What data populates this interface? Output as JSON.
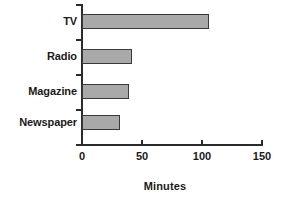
{
  "chart_data": {
    "type": "bar",
    "orientation": "horizontal",
    "title": "",
    "subtitle": "",
    "xlabel": "Minutes",
    "ylabel": "",
    "categories": [
      "TV",
      "Radio",
      "Magazine",
      "Newspaper"
    ],
    "values": [
      106,
      42,
      39,
      32
    ],
    "series": [
      {
        "name": "Minutes",
        "values": [
          106,
          42,
          39,
          32
        ]
      }
    ],
    "xlim": [
      0,
      150
    ],
    "xticks": [
      0,
      50,
      100,
      150
    ],
    "xtick_labels": [
      "0",
      "50",
      "100",
      "150"
    ],
    "grid": false,
    "legend": false,
    "legend_position": "none",
    "bar_fill_color": "#a9a9a9",
    "bar_border_color": "#3a3a3a",
    "axis_color": "#2b2b2b",
    "background_color": "#ffffff"
  }
}
